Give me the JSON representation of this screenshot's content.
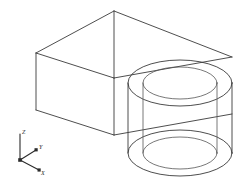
{
  "drawing": {
    "title": "Isometric wireframe solid",
    "description": "Rectangular block with two concentric vertical cylinders forming a boss with a through hole",
    "background_color": "#ffffff",
    "line_color": "#3a3a3a",
    "line_color_soft": "#555555",
    "width": 235,
    "height": 182,
    "view": "SE Isometric"
  },
  "ucs_icon": {
    "name": "ucs-axis-indicator",
    "origin": {
      "x": 20,
      "y": 160
    },
    "axes": [
      {
        "id": "z-axis",
        "label": "Z",
        "tip_x": 20,
        "tip_y": 133,
        "label_x": 22,
        "label_y": 134,
        "has_marker": false
      },
      {
        "id": "y-axis",
        "label": "Y",
        "tip_x": 37,
        "tip_y": 149,
        "label_x": 39,
        "label_y": 148,
        "has_marker": true
      },
      {
        "id": "x-axis",
        "label": "X",
        "tip_x": 40,
        "tip_y": 171,
        "label_x": 41,
        "label_y": 174,
        "has_marker": true
      }
    ],
    "origin_marker": true
  },
  "box": {
    "name": "rectangular-block",
    "vertices": {
      "top_back": {
        "x": 114,
        "y": 11
      },
      "top_left": {
        "x": 36,
        "y": 53
      },
      "top_front": {
        "x": 114,
        "y": 78
      },
      "top_right": {
        "x": 232,
        "y": 57
      },
      "bottom_left": {
        "x": 36,
        "y": 110
      },
      "bottom_front": {
        "x": 114,
        "y": 135
      },
      "bottom_right": {
        "x": 232,
        "y": 114
      }
    },
    "edges": [
      "top_back-top_left",
      "top_back-top_right",
      "top_left-top_front",
      "top_front-top_right",
      "top_left-bottom_left",
      "top_front-bottom_front",
      "bottom_left-bottom_front",
      "bottom_front-bottom_right",
      "top_back-top_front"
    ]
  },
  "cylinders": [
    {
      "name": "outer-cylinder",
      "center_x": 180,
      "top_center_y": 83,
      "bottom_center_y": 153,
      "radius_x": 52,
      "radius_y": 23,
      "height": 70
    },
    {
      "name": "inner-cylinder",
      "center_x": 180,
      "top_center_y": 83,
      "bottom_center_y": 153,
      "radius_x": 37,
      "radius_y": 16,
      "height": 70
    }
  ],
  "legend": {
    "has_dimensions": false,
    "has_text_annotations": false
  }
}
